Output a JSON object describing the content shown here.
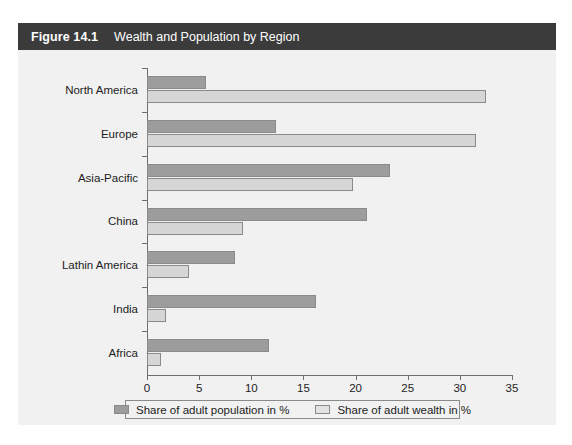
{
  "figure": {
    "number": "Figure 14.1",
    "title": "Wealth and Population by Region",
    "header_bg": "#3b3b3b",
    "header_text_color": "#ffffff",
    "panel_bg": "#f1f1f1"
  },
  "chart_data": {
    "type": "bar",
    "orientation": "horizontal",
    "title": "Wealth and Population by Region",
    "xlabel": "",
    "ylabel": "",
    "xlim": [
      0,
      35
    ],
    "xticks": [
      0,
      5,
      10,
      15,
      20,
      25,
      30,
      35
    ],
    "grid": false,
    "legend_position": "bottom",
    "categories": [
      "North America",
      "Europe",
      "Asia-Pacific",
      "China",
      "Lathin America",
      "India",
      "Africa"
    ],
    "series": [
      {
        "name": "Share of adult population in %",
        "color": "#9d9d9d",
        "values": [
          5.7,
          12.4,
          23.3,
          21.1,
          8.4,
          16.2,
          11.7
        ]
      },
      {
        "name": "Share of adult wealth in %",
        "color": "#d6d6d6",
        "values": [
          32.5,
          31.5,
          19.8,
          9.2,
          4.0,
          1.8,
          1.3
        ]
      }
    ]
  },
  "legend": {
    "entries": [
      {
        "label": "Share of adult population in %",
        "swatch": "#9d9d9d"
      },
      {
        "label": "Share of adult wealth in %",
        "swatch": "#e2e2e2"
      }
    ]
  }
}
